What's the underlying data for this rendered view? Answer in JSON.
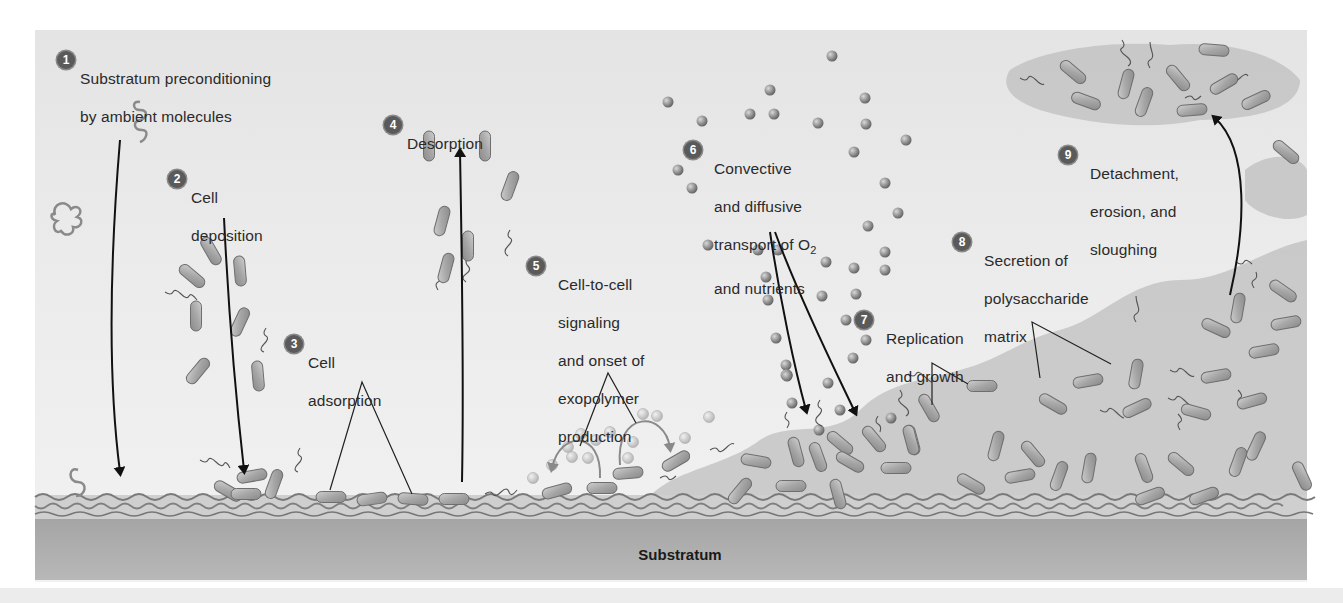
{
  "figure": {
    "substratum_label": "Substratum",
    "colors": {
      "panel_bg": "#e8e8e8",
      "badge_fill": "#5a5a5a",
      "badge_text": "#ffffff",
      "cell_fill": "#a8a8a8",
      "cell_stroke": "#6a6a6a",
      "nutrient_dot": "#8c8c8c",
      "matrix_fill": "#bdbdbd",
      "substratum_fill": "#a9a9a9",
      "arrow": "#111111",
      "text": "#2a2a2a"
    }
  },
  "steps": [
    {
      "number": "1",
      "label_lines": [
        "Substratum preconditioning",
        "by ambient molecules"
      ],
      "arrow": "down"
    },
    {
      "number": "2",
      "label_lines": [
        "Cell",
        "deposition"
      ],
      "arrow": "down"
    },
    {
      "number": "3",
      "label_lines": [
        "Cell",
        "adsorption"
      ],
      "pointer": "two-line"
    },
    {
      "number": "4",
      "label_lines": [
        "Desorption"
      ],
      "arrow": "up"
    },
    {
      "number": "5",
      "label_lines": [
        "Cell-to-cell",
        "signaling",
        "and onset of",
        "exopolymer",
        "production"
      ],
      "pointer": "two-line"
    },
    {
      "number": "6",
      "label_lines": [
        "Convective",
        "and diffusive",
        "transport of O",
        "and nutrients"
      ],
      "subscript": "2",
      "arrow": "down-double"
    },
    {
      "number": "7",
      "label_lines": [
        "Replication",
        "and growth"
      ],
      "pointer": "two-line"
    },
    {
      "number": "8",
      "label_lines": [
        "Secretion of",
        "polysaccharide",
        "matrix"
      ],
      "pointer": "two-line"
    },
    {
      "number": "9",
      "label_lines": [
        "Detachment,",
        "erosion, and",
        "sloughing"
      ],
      "arrow": "up"
    }
  ]
}
